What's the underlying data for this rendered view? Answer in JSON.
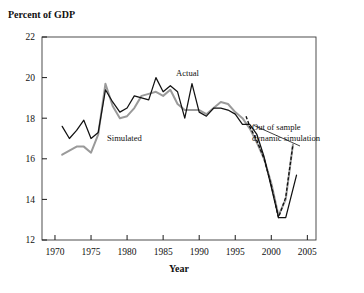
{
  "figure": {
    "ylabel_top": "Percent of GDP",
    "xlabel": "Year"
  },
  "annotations": {
    "actual": "Actual",
    "simulated": "Simulated",
    "out_of_sample_line1": "Out of sample",
    "out_of_sample_line2": "dynamic simulation"
  },
  "chart_data": {
    "type": "line",
    "title": "Percent of GDP",
    "xlabel": "Year",
    "ylabel": "Percent of GDP",
    "xlim": [
      1968.2,
      2006.2
    ],
    "ylim": [
      12,
      22
    ],
    "xticks": [
      1970,
      1975,
      1980,
      1985,
      1990,
      1995,
      2000,
      2005
    ],
    "yticks": [
      12,
      14,
      16,
      18,
      20,
      22
    ],
    "grid": false,
    "legend": "none (inline annotations)",
    "series": [
      {
        "name": "Actual",
        "style": "solid-black",
        "color": "#111111",
        "x": [
          1971,
          1972,
          1973,
          1974,
          1975,
          1976,
          1977,
          1978,
          1979,
          1980,
          1981,
          1982,
          1983,
          1984,
          1985,
          1986,
          1987,
          1988,
          1989,
          1990,
          1991,
          1992,
          1993,
          1994,
          1995,
          1996,
          1997,
          1998,
          1999,
          2000,
          2001,
          2002,
          2003.5
        ],
        "y": [
          17.6,
          17.0,
          17.4,
          17.9,
          17.0,
          17.3,
          19.4,
          18.8,
          18.3,
          18.5,
          19.1,
          19.0,
          18.9,
          20.0,
          19.3,
          19.6,
          19.3,
          18.0,
          19.7,
          18.3,
          18.1,
          18.5,
          18.5,
          18.4,
          18.2,
          17.7,
          17.7,
          17.2,
          16.1,
          14.6,
          13.1,
          13.1,
          15.2
        ]
      },
      {
        "name": "Simulated",
        "style": "solid-gray",
        "color": "#9a9a9a",
        "x": [
          1971,
          1972,
          1973,
          1974,
          1975,
          1976,
          1977,
          1978,
          1979,
          1980,
          1981,
          1982,
          1983,
          1984,
          1985,
          1986,
          1987,
          1988,
          1989,
          1990,
          1991,
          1992,
          1993,
          1994,
          1995,
          1996,
          1997,
          1998,
          1999,
          2000,
          2001,
          2002,
          2003
        ],
        "y": [
          16.2,
          16.4,
          16.6,
          16.6,
          16.3,
          17.2,
          19.7,
          18.6,
          18.0,
          18.1,
          18.5,
          19.1,
          19.2,
          19.3,
          19.1,
          19.4,
          18.7,
          18.4,
          18.4,
          18.4,
          18.2,
          18.5,
          18.8,
          18.7,
          18.3,
          18.0,
          17.5,
          16.8,
          16.0,
          14.8,
          13.2,
          14.0,
          16.7
        ]
      },
      {
        "name": "Out of sample dynamic simulation",
        "style": "dashed-black",
        "color": "#111111",
        "x": [
          1996.5,
          1997,
          1998,
          1999,
          2000,
          2001,
          2002,
          2003
        ],
        "y": [
          18.1,
          17.6,
          16.9,
          16.0,
          14.7,
          13.1,
          14.1,
          16.7
        ]
      }
    ]
  },
  "geometry": {
    "plot_left": 42,
    "plot_right": 316,
    "plot_top": 37,
    "plot_bottom": 240
  }
}
